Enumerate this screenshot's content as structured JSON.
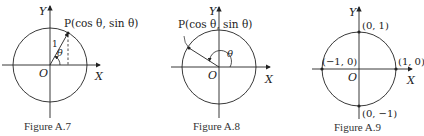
{
  "figures": [
    {
      "id": "A.7",
      "caption": "Figure A.7",
      "axis_y": "Y",
      "axis_x": "X",
      "origin": "O",
      "point_label": "P(cos θ,  sin θ)",
      "radius_label": "1",
      "angle_label": "θ"
    },
    {
      "id": "A.8",
      "caption": "Figure A.8",
      "axis_y": "Y",
      "axis_x": "X",
      "origin": "O",
      "point_label": "P(cos θ, sin θ)",
      "angle_label": "θ"
    },
    {
      "id": "A.9",
      "caption": "Figure A.9",
      "axis_y": "Y",
      "axis_x": "X",
      "origin": "O",
      "points": [
        "(0, 1)",
        "(−1, 0)",
        "(1, 0)",
        "(0, −1)"
      ]
    }
  ],
  "colors": {
    "stroke": "#222222",
    "background": "#ffffff"
  }
}
